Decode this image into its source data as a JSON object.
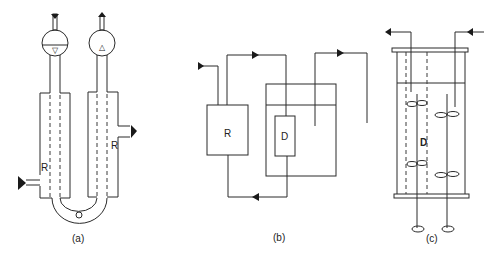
{
  "figure": {
    "panels": [
      {
        "id": "a",
        "caption": "(a)",
        "labels": {
          "left_jacket": "R",
          "right_jacket": "R"
        },
        "symbols": {
          "left_bulb": "▽",
          "right_bulb": "△"
        },
        "components": [
          "left jacketed tube",
          "right jacketed tube",
          "U-bend connector",
          "left bulb with liquid level",
          "right bulb",
          "inlet arrow left",
          "outlet arrow right"
        ]
      },
      {
        "id": "b",
        "caption": "(b)",
        "labels": {
          "reactor": "R",
          "dialyser": "D"
        },
        "components": [
          "reactor box R",
          "vessel with liquid level",
          "dialyser box D",
          "recirculation loop with flow arrows",
          "inlet/outlet lines"
        ]
      },
      {
        "id": "c",
        "caption": "(c)",
        "labels": {
          "dialysis_zone": "D"
        },
        "components": [
          "cylindrical vessel with flanges",
          "liquid level",
          "dashed membrane lines",
          "two stirrer shafts with impellers",
          "inlet and outlet arrows"
        ]
      }
    ]
  }
}
